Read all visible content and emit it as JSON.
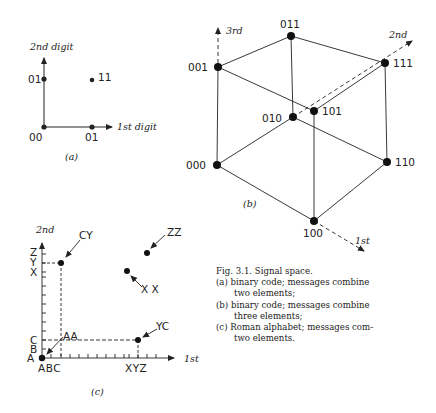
{
  "figure": {
    "panel_a": {
      "label": "(a)",
      "x_axis_label": "1st digit",
      "y_axis_label": "2nd digit",
      "points": [
        {
          "label": "00",
          "x": 0,
          "y": 0
        },
        {
          "label": "01",
          "x": 1,
          "y": 0
        },
        {
          "label": "01",
          "x": 0,
          "y": 1
        },
        {
          "label": "11",
          "x": 1,
          "y": 1
        }
      ]
    },
    "panel_b": {
      "label": "(b)",
      "axis_labels": {
        "first": "1st",
        "second": "2nd",
        "third": "3rd"
      },
      "vertices": {
        "v000": "000",
        "v001": "001",
        "v010": "010",
        "v011": "011",
        "v100": "100",
        "v101": "101",
        "v110": "110",
        "v111": "111"
      }
    },
    "panel_c": {
      "label": "(c)",
      "x_axis_label": "1st",
      "y_axis_label": "2nd",
      "x_ticks_start": "ABC",
      "x_ticks_end": "XYZ",
      "y_ticks": {
        "A": "A",
        "B": "B",
        "C": "C",
        "X": "X",
        "Y": "Y",
        "Z": "Z"
      },
      "points": {
        "AA": "AA",
        "CY": "CY",
        "YC": "YC",
        "XX": "X X",
        "ZZ": "ZZ"
      }
    },
    "caption": {
      "title": "Fig. 3.1. Signal space.",
      "items": [
        {
          "prefix": "(a)",
          "line1": "binary code; messages combine",
          "line2": "two elements;"
        },
        {
          "prefix": "(b)",
          "line1": "binary code; messages combine",
          "line2": "three elements;"
        },
        {
          "prefix": "(c)",
          "line1": "Roman alphabet; messages com-",
          "line2": "two elements."
        }
      ]
    }
  }
}
